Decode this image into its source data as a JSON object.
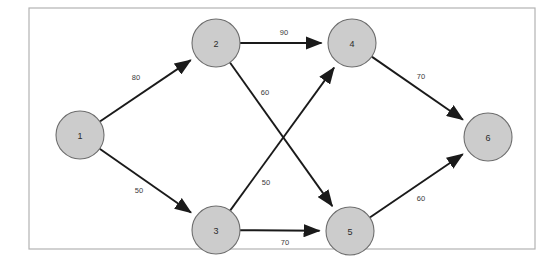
{
  "figure": {
    "kind": "directed-weighted-graph",
    "frame": {
      "x": 29,
      "y": 8,
      "width": 506,
      "height": 241
    },
    "canvas": {
      "width": 558,
      "height": 258
    },
    "colors": {
      "node_fill": "#cccccc",
      "node_stroke": "#6e6e6e",
      "edge": "#1a1a1a",
      "weight_text": "#3a3a3a",
      "frame": "#b3b3b3",
      "background": "#ffffff"
    },
    "node_radius": 24
  },
  "chart_data": {
    "type": "diagram",
    "title": "",
    "nodes": [
      {
        "id": "n1",
        "label": "1",
        "x": 80,
        "y": 135
      },
      {
        "id": "n2",
        "label": "2",
        "x": 216,
        "y": 43
      },
      {
        "id": "n3",
        "label": "3",
        "x": 216,
        "y": 230
      },
      {
        "id": "n4",
        "label": "4",
        "x": 352,
        "y": 43
      },
      {
        "id": "n5",
        "label": "5",
        "x": 350,
        "y": 231
      },
      {
        "id": "n6",
        "label": "6",
        "x": 488,
        "y": 137
      }
    ],
    "edges": [
      {
        "id": "e12",
        "from": "n1",
        "to": "n2",
        "weight": "80",
        "label_x": 136,
        "label_y": 77,
        "directed": true
      },
      {
        "id": "e13",
        "from": "n1",
        "to": "n3",
        "weight": "50",
        "label_x": 139,
        "label_y": 190,
        "directed": true
      },
      {
        "id": "e24",
        "from": "n2",
        "to": "n4",
        "weight": "90",
        "label_x": 284,
        "label_y": 32,
        "directed": true
      },
      {
        "id": "e25",
        "from": "n2",
        "to": "n5",
        "weight": "60",
        "label_x": 265,
        "label_y": 92,
        "directed": true
      },
      {
        "id": "e34",
        "from": "n3",
        "to": "n4",
        "weight": "50",
        "label_x": 266,
        "label_y": 182,
        "directed": true
      },
      {
        "id": "e35",
        "from": "n3",
        "to": "n5",
        "weight": "70",
        "label_x": 285,
        "label_y": 242,
        "directed": true
      },
      {
        "id": "e46",
        "from": "n4",
        "to": "n6",
        "weight": "70",
        "label_x": 421,
        "label_y": 76,
        "directed": true
      },
      {
        "id": "e56",
        "from": "n5",
        "to": "n6",
        "weight": "60",
        "label_x": 421,
        "label_y": 198,
        "directed": true
      }
    ]
  }
}
